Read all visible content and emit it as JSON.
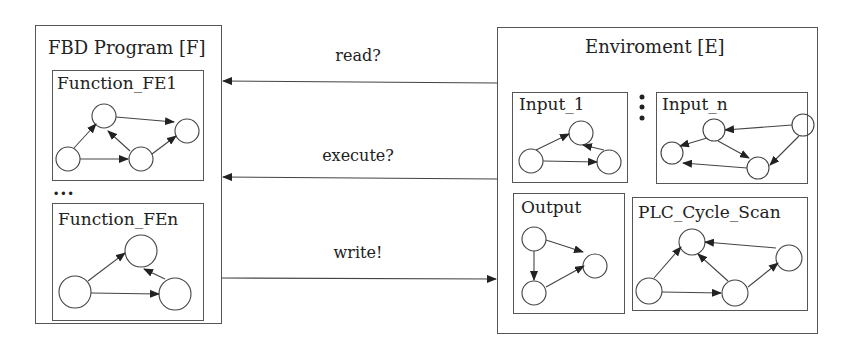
{
  "program": {
    "title": "FBD Program [F]",
    "functions": [
      {
        "label": "Function_FE1"
      },
      {
        "label": "Function_FEn"
      }
    ],
    "ellipsis": "..."
  },
  "environment": {
    "title": "Enviroment [E]",
    "components": [
      {
        "label": "Input_1"
      },
      {
        "label": "Input_n"
      },
      {
        "label": "Output"
      },
      {
        "label": "PLC_Cycle_Scan"
      }
    ],
    "vertical_ellipsis": "⋮"
  },
  "messages": [
    {
      "label": "read?",
      "direction": "E-to-F"
    },
    {
      "label": "execute?",
      "direction": "E-to-F"
    },
    {
      "label": "write!",
      "direction": "F-to-E"
    }
  ],
  "colors": {
    "stroke": "#555555",
    "text": "#222222",
    "background": "#ffffff"
  }
}
